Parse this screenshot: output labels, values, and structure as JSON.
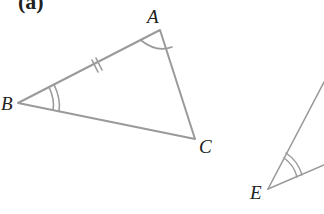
{
  "figure": {
    "part_label": "(a)",
    "stroke_color": "#9a9a9a",
    "label_color": "#222222",
    "triangle_abc": {
      "vertices": {
        "A": {
          "label": "A",
          "x": 160,
          "y": 30
        },
        "B": {
          "label": "B",
          "x": 18,
          "y": 103
        },
        "C": {
          "label": "C",
          "x": 195,
          "y": 139
        }
      },
      "markings": {
        "side_AB": "double tick (equal side)",
        "angle_A": "single arc",
        "angle_B": "double arc"
      }
    },
    "partial_angle_e": {
      "vertex": {
        "label": "E",
        "x": 268,
        "y": 189
      },
      "markings": {
        "angle_E": "double arc"
      }
    }
  }
}
